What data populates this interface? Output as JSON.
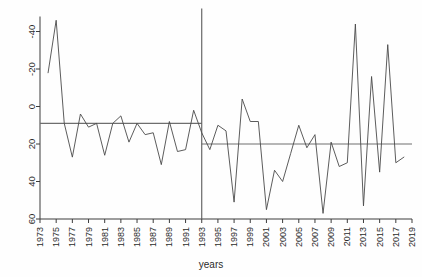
{
  "chart_data": {
    "type": "line",
    "title": "",
    "xlabel": "years",
    "ylabel": "",
    "xlim": [
      1973,
      2019
    ],
    "ylim": [
      -40,
      68
    ],
    "grid": false,
    "legend": "none",
    "x_ticks": [
      1973,
      1975,
      1977,
      1979,
      1981,
      1983,
      1985,
      1987,
      1989,
      1991,
      1993,
      1995,
      1997,
      1999,
      2001,
      2003,
      2005,
      2007,
      2009,
      2011,
      2013,
      2015,
      2017,
      2019
    ],
    "y_ticks": [
      -40,
      -20,
      0,
      20,
      40,
      60
    ],
    "x": [
      1974,
      1975,
      1976,
      1977,
      1978,
      1979,
      1980,
      1981,
      1982,
      1983,
      1984,
      1985,
      1986,
      1987,
      1988,
      1989,
      1990,
      1991,
      1992,
      1993,
      1994,
      1995,
      1996,
      1997,
      1998,
      1999,
      2000,
      2001,
      2002,
      2003,
      2004,
      2005,
      2006,
      2007,
      2008,
      2009,
      2010,
      2011,
      2012,
      2013,
      2014,
      2015,
      2016,
      2017,
      2018
    ],
    "series": [
      {
        "name": "annual value",
        "values": [
          38,
          66,
          11,
          -7,
          16,
          9,
          11,
          -6,
          11,
          15,
          1,
          11,
          5,
          6,
          -11,
          12,
          -4,
          -3,
          18,
          6,
          -3,
          10,
          7,
          -31,
          24,
          12,
          12,
          -35,
          -14,
          -20,
          -5,
          10,
          -2,
          5,
          -37,
          1,
          -12,
          -10,
          64,
          -33,
          36,
          -15,
          53,
          -10,
          -7
        ]
      }
    ],
    "annotations": {
      "vertical_line": {
        "name": "breakpoint-1993",
        "x": 1993,
        "label": "1993"
      },
      "horizontal_segments": [
        {
          "name": "pre-1993-mean",
          "value": 11,
          "x_start": 1973,
          "x_end": 1993
        },
        {
          "name": "post-1993-mean",
          "value": 0,
          "x_start": 1993,
          "x_end": 2019
        }
      ]
    },
    "colors": {
      "series_line": "#4a4a4a",
      "reference_line": "#6e6e6e",
      "axis": "#3c3c3c",
      "background": "#fefefe"
    }
  },
  "axis": {
    "x_title": "years",
    "y_tick_labels": [
      "60",
      "40",
      "20",
      "0",
      "-20",
      "-40"
    ],
    "x_tick_labels": [
      "1973",
      "1975",
      "1977",
      "1979",
      "1981",
      "1983",
      "1985",
      "1987",
      "1989",
      "1991",
      "1993",
      "1995",
      "1997",
      "1999",
      "2001",
      "2003",
      "2005",
      "2007",
      "2009",
      "2011",
      "2013",
      "2015",
      "2017",
      "2019"
    ]
  }
}
